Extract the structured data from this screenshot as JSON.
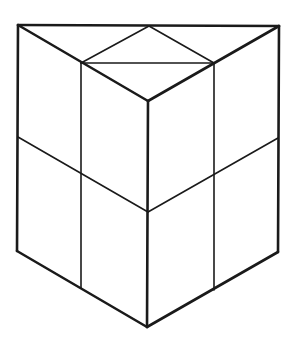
{
  "diagram": {
    "title": "Triangular prism divided into smaller triangular prisms",
    "stroke_color": "#1a1a1a",
    "background": "#ffffff",
    "thick_width": 2.6,
    "thin_width": 1.6,
    "vertices": {
      "top_left": [
        18,
        25
      ],
      "top_mid": [
        149,
        26
      ],
      "top_right": [
        279,
        26
      ],
      "top_inner_left": [
        81,
        63
      ],
      "top_inner_right": [
        214,
        63
      ],
      "top_front": [
        148,
        101
      ],
      "mid_left": [
        18,
        137
      ],
      "mid_inner_left": [
        81,
        174
      ],
      "mid_front": [
        148,
        212
      ],
      "mid_inner_right": [
        214,
        175
      ],
      "mid_right": [
        278,
        138
      ],
      "bot_left": [
        17,
        251
      ],
      "bot_inner_left": [
        81,
        288
      ],
      "bot_front": [
        147,
        327
      ],
      "bot_inner_right": [
        214,
        290
      ],
      "bot_right": [
        278,
        252
      ]
    },
    "thick_edges": [
      [
        "top_left",
        "top_right"
      ],
      [
        "top_left",
        "top_front"
      ],
      [
        "top_right",
        "top_front"
      ],
      [
        "top_left",
        "bot_left"
      ],
      [
        "top_right",
        "bot_right"
      ],
      [
        "top_front",
        "bot_front"
      ],
      [
        "bot_left",
        "bot_front"
      ],
      [
        "bot_right",
        "bot_front"
      ]
    ],
    "thin_edges": [
      [
        "top_mid",
        "top_inner_left"
      ],
      [
        "top_mid",
        "top_inner_right"
      ],
      [
        "top_inner_left",
        "top_inner_right"
      ],
      [
        "top_inner_left",
        "bot_inner_left"
      ],
      [
        "top_inner_right",
        "bot_inner_right"
      ],
      [
        "mid_left",
        "mid_front"
      ],
      [
        "mid_right",
        "mid_front"
      ]
    ]
  }
}
